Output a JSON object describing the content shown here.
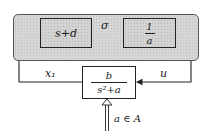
{
  "diagram": {
    "type": "block-diagram",
    "outer_group": {
      "shaded": true,
      "rounded": true
    },
    "blocks": [
      {
        "id": "block1",
        "expression": "s+d"
      },
      {
        "id": "block2",
        "numerator": "1",
        "denominator": "a"
      },
      {
        "id": "plant",
        "numerator": "b",
        "denominator": "s²+a"
      }
    ],
    "signals": {
      "between_blocks": "σ",
      "left_feedback": "x₁",
      "right_feedback": "u",
      "parameter_input": "a ∈ A"
    },
    "colors": {
      "shading": "#d3d3d3",
      "line": "#222222"
    }
  }
}
